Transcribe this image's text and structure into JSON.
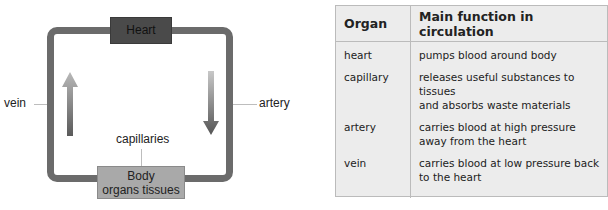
{
  "diagram": {
    "heart_label": "Heart",
    "body_line1": "Body",
    "body_line2": "organs tissues",
    "capillaries_label": "capillaries",
    "vein_label": "vein",
    "artery_label": "artery",
    "colors": {
      "loop": "#6b6b6b",
      "heart_box": "#4a4a4a",
      "body_box": "#a9a9a9"
    }
  },
  "table": {
    "headers": [
      "Organ",
      "Main function in circulation"
    ],
    "rows": [
      {
        "organ": "heart",
        "function_line1": "pumps blood around body",
        "function_line2": ""
      },
      {
        "organ": "capillary",
        "function_line1": "releases useful substances to tissues",
        "function_line2": "and absorbs waste materials"
      },
      {
        "organ": "artery",
        "function_line1": "carries blood at high pressure",
        "function_line2": "away from the heart"
      },
      {
        "organ": "vein",
        "function_line1": "carries blood at low pressure back",
        "function_line2": "to the heart"
      }
    ]
  }
}
